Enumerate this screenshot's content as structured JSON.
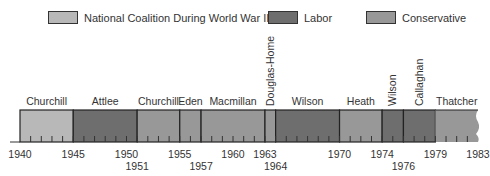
{
  "chart_data": {
    "type": "timeline",
    "title": "",
    "xlabel": "",
    "ylabel": "",
    "xlim": [
      1940,
      1983
    ],
    "legend": [
      {
        "key": "coalition",
        "label": "National Coalition During World War II",
        "color": "#b8b8b8"
      },
      {
        "key": "labor",
        "label": "Labor",
        "color": "#6e6e6e"
      },
      {
        "key": "conservative",
        "label": "Conservative",
        "color": "#989898"
      }
    ],
    "legend_placement": "top",
    "segments": [
      {
        "name": "Churchill",
        "start": 1940,
        "end": 1945,
        "party": "coalition",
        "vertical_label": false
      },
      {
        "name": "Attlee",
        "start": 1945,
        "end": 1951,
        "party": "labor",
        "vertical_label": false
      },
      {
        "name": "Churchill",
        "start": 1951,
        "end": 1955,
        "party": "conservative",
        "vertical_label": false
      },
      {
        "name": "Eden",
        "start": 1955,
        "end": 1957,
        "party": "conservative",
        "vertical_label": false
      },
      {
        "name": "Macmillan",
        "start": 1957,
        "end": 1963,
        "party": "conservative",
        "vertical_label": false
      },
      {
        "name": "Douglas-Home",
        "start": 1963,
        "end": 1964,
        "party": "conservative",
        "vertical_label": true
      },
      {
        "name": "Wilson",
        "start": 1964,
        "end": 1970,
        "party": "labor",
        "vertical_label": false
      },
      {
        "name": "Heath",
        "start": 1970,
        "end": 1974,
        "party": "conservative",
        "vertical_label": false
      },
      {
        "name": "Wilson",
        "start": 1974,
        "end": 1976,
        "party": "labor",
        "vertical_label": true
      },
      {
        "name": "Callaghan",
        "start": 1976,
        "end": 1979,
        "party": "labor",
        "vertical_label": true
      },
      {
        "name": "Thatcher",
        "start": 1979,
        "end": 1983,
        "party": "conservative",
        "vertical_label": false
      }
    ],
    "tick_labels_row1": [
      "1940",
      "1945",
      "1950",
      "1955",
      "1960",
      "1963",
      "1970",
      "1974",
      "1979",
      "1983"
    ],
    "tick_labels_row2": [
      "1951",
      "1957",
      "1964",
      "1976"
    ],
    "minor_ticks": "yearly"
  }
}
